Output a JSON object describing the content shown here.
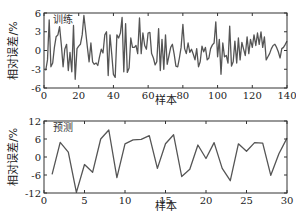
{
  "chart_data": [
    {
      "type": "line",
      "title": "",
      "annotation": "训练",
      "xlabel": "样本",
      "ylabel": "相对误差/%",
      "xlim": [
        0,
        140
      ],
      "ylim": [
        -6,
        6
      ],
      "xticks": [
        0,
        20,
        40,
        60,
        80,
        100,
        120,
        140
      ],
      "yticks": [
        -6,
        -3,
        0,
        3,
        6
      ],
      "grid": false,
      "line_color": "#555555",
      "x": [
        1,
        2,
        3,
        4,
        5,
        6,
        7,
        8,
        9,
        10,
        11,
        12,
        13,
        14,
        15,
        16,
        17,
        18,
        19,
        20,
        21,
        22,
        23,
        24,
        25,
        26,
        27,
        28,
        29,
        30,
        31,
        32,
        33,
        34,
        35,
        36,
        37,
        38,
        39,
        40,
        41,
        42,
        43,
        44,
        45,
        46,
        47,
        48,
        49,
        50,
        51,
        52,
        53,
        54,
        55,
        56,
        57,
        58,
        59,
        60,
        61,
        62,
        63,
        64,
        65,
        66,
        67,
        68,
        69,
        70,
        71,
        72,
        73,
        74,
        75,
        76,
        77,
        78,
        79,
        80,
        81,
        82,
        83,
        84,
        85,
        86,
        87,
        88,
        89,
        90,
        91,
        92,
        93,
        94,
        95,
        96,
        97,
        98,
        99,
        100,
        101,
        102,
        103,
        104,
        105,
        106,
        107,
        108,
        109,
        110,
        111,
        112,
        113,
        114,
        115,
        116,
        117,
        118,
        119,
        120,
        121,
        122,
        123,
        124,
        125,
        126,
        127,
        128,
        129,
        130,
        131,
        132,
        133,
        134,
        135,
        136,
        137,
        138,
        139,
        140
      ],
      "values": [
        -3.2,
        -1.5,
        4.9,
        -2.6,
        -2.0,
        0.5,
        2.2,
        2.5,
        3.8,
        0.8,
        -2.6,
        0.2,
        1.0,
        -3.2,
        -0.3,
        -3.4,
        4.0,
        -4.6,
        0.3,
        0.7,
        1.0,
        2.5,
        5.6,
        3.0,
        0.5,
        -1.8,
        1.2,
        -1.8,
        -2.2,
        -2.0,
        -2.4,
        -1.0,
        0.2,
        -0.4,
        2.5,
        3.0,
        -4.0,
        2.5,
        -0.5,
        -3.8,
        -4.3,
        2.5,
        2.0,
        2.8,
        5.3,
        -3.4,
        4.3,
        -3.5,
        -2.8,
        2.0,
        0.5,
        0.5,
        0.8,
        -0.5,
        5.2,
        -0.5,
        2.8,
        0.8,
        0.2,
        2.8,
        2.9,
        -0.5,
        -1.2,
        -2.3,
        -1.8,
        3.5,
        -3.2,
        1.8,
        -3.0,
        2.5,
        -2.2,
        -0.8,
        0.5,
        1.0,
        -0.6,
        -2.5,
        -2.6,
        -1.2,
        0.5,
        4.2,
        0.3,
        -0.5,
        1.2,
        -0.3,
        0.2,
        -0.6,
        -1.5,
        0.3,
        -2.6,
        -1.8,
        0.7,
        -0.2,
        0.5,
        -1.5,
        -1.2,
        0.3,
        0.9,
        1.2,
        4.6,
        -1.0,
        1.8,
        -3.8,
        1.2,
        -1.0,
        -0.8,
        -2.0,
        3.9,
        -2.5,
        -1.8,
        1.5,
        -2.0,
        2.0,
        -1.5,
        1.3,
        0.2,
        -0.8,
        2.2,
        -0.5,
        1.8,
        0.5,
        2.5,
        0.8,
        2.8,
        1.0,
        3.0,
        0.5,
        2.2,
        -1.5,
        -1.0,
        -0.5,
        0.3,
        0.8,
        1.0,
        0.5,
        -0.2,
        -1.2,
        0.3,
        0.5,
        1.0,
        1.5
      ]
    },
    {
      "type": "line",
      "title": "",
      "annotation": "预测",
      "xlabel": "样本",
      "ylabel": "相对误差/%",
      "xlim": [
        0,
        30
      ],
      "ylim": [
        -12,
        12
      ],
      "xticks": [
        0,
        5,
        10,
        15,
        20,
        25,
        30
      ],
      "yticks": [
        -12,
        -6,
        0,
        6,
        12
      ],
      "grid": false,
      "line_color": "#555555",
      "x": [
        1,
        2,
        3,
        4,
        5,
        6,
        7,
        8,
        9,
        10,
        11,
        12,
        13,
        14,
        15,
        16,
        17,
        18,
        19,
        20,
        21,
        22,
        23,
        24,
        25,
        26,
        27,
        28,
        29,
        30
      ],
      "values": [
        -5.8,
        4.9,
        1.6,
        -11.8,
        -2.5,
        -5.1,
        6.0,
        9.0,
        -6.9,
        4.4,
        5.7,
        5.9,
        7.1,
        -3.8,
        4.4,
        7.4,
        -6.5,
        -4.1,
        4.0,
        -0.5,
        4.8,
        -3.8,
        -7.9,
        4.4,
        1.9,
        4.8,
        4.6,
        -6.1,
        1.1,
        6.3
      ]
    }
  ]
}
